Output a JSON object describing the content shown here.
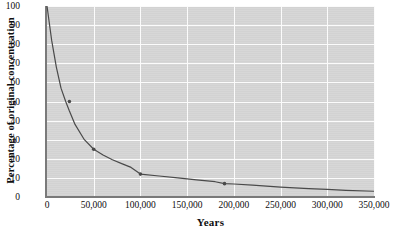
{
  "chart_data": {
    "type": "line",
    "title": "",
    "xlabel": "Years",
    "ylabel": "Percentage of original concentration",
    "xlim": [
      0,
      350000
    ],
    "ylim": [
      0,
      100
    ],
    "grid": true,
    "legend": "none",
    "xticks": [
      0,
      50000,
      100000,
      150000,
      200000,
      250000,
      300000,
      350000
    ],
    "xtick_labels": [
      "0",
      "50,000",
      "100,000",
      "150,000",
      "200,000",
      "250,000",
      "300,000",
      "350,000"
    ],
    "yticks": [
      0,
      10,
      20,
      30,
      40,
      50,
      60,
      70,
      80,
      90,
      100
    ],
    "ytick_labels": [
      "0",
      "10",
      "20",
      "30",
      "40",
      "50",
      "60",
      "70",
      "80",
      "90",
      "100"
    ],
    "series": [
      {
        "name": "Percentage of original concentration",
        "marker": "dot",
        "line_color": "#4a4a4a",
        "x": [
          0,
          5000,
          10000,
          15000,
          20000,
          24000,
          30000,
          40000,
          50000,
          60000,
          70000,
          80000,
          90000,
          100000,
          120000,
          140000,
          160000,
          180000,
          190000,
          200000,
          220000,
          250000,
          280000,
          300000,
          320000,
          350000
        ],
        "y": [
          100,
          82,
          68,
          57,
          50,
          45,
          38,
          30,
          25,
          22,
          19.5,
          17.5,
          15.5,
          12,
          11,
          10,
          9,
          8,
          7,
          6.8,
          6.2,
          5.2,
          4.4,
          4.0,
          3.5,
          3.0
        ]
      }
    ],
    "data_point_markers": [
      {
        "x": 24000,
        "y": 50,
        "label": ""
      },
      {
        "x": 50000,
        "y": 25,
        "label": ""
      },
      {
        "x": 100000,
        "y": 12,
        "label": ""
      },
      {
        "x": 190000,
        "y": 7,
        "label": ""
      }
    ],
    "colors": {
      "plot_background": "#d6d6d6",
      "gridline": "#fbfbfb",
      "axis": "#7a7a7a",
      "curve": "#4a4a4a",
      "text": "#0d0d0d"
    }
  }
}
